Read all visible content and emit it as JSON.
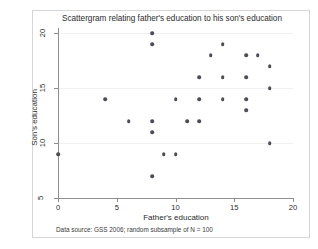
{
  "chart_data": {
    "type": "scatter",
    "title": "Scattergram relating father's education to his son's education",
    "xlabel": "Father's education",
    "ylabel": "Son's education",
    "note": "Data source: GSS 2006; random subsample of N = 100",
    "xlim": [
      0,
      20
    ],
    "ylim": [
      5,
      20
    ],
    "xticks": [
      0,
      5,
      10,
      15,
      20
    ],
    "yticks": [
      5,
      10,
      15,
      20
    ],
    "xticklabels": [
      "0",
      "5",
      "10",
      "15",
      "20"
    ],
    "yticklabels": [
      "5",
      "10",
      "15",
      "20"
    ],
    "grid": "horizontal-faint",
    "legend": "none",
    "marker": {
      "shape": "circle",
      "color": "#4c4c57",
      "size": 3.6
    },
    "series": [
      {
        "name": "father-son education pairs",
        "points": [
          [
            0,
            9
          ],
          [
            4,
            14
          ],
          [
            6,
            12
          ],
          [
            8,
            20
          ],
          [
            8,
            19
          ],
          [
            8,
            12
          ],
          [
            8,
            11
          ],
          [
            8,
            7
          ],
          [
            9,
            9
          ],
          [
            10,
            9
          ],
          [
            10,
            14
          ],
          [
            11,
            12
          ],
          [
            12,
            12
          ],
          [
            12,
            16
          ],
          [
            12,
            14
          ],
          [
            13,
            18
          ],
          [
            14,
            19
          ],
          [
            14,
            16
          ],
          [
            14,
            14
          ],
          [
            16,
            18
          ],
          [
            16,
            16
          ],
          [
            16,
            14
          ],
          [
            16,
            13
          ],
          [
            17,
            18
          ],
          [
            18,
            17
          ],
          [
            18,
            15
          ],
          [
            18,
            10
          ]
        ]
      }
    ]
  }
}
